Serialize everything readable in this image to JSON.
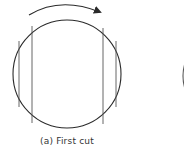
{
  "figure": {
    "caption": "(a) First cut",
    "stroke_color": "#2a2a2a",
    "cut_line_color": "#555555",
    "main_circle": {
      "cx": 67,
      "cy": 74,
      "r": 54
    },
    "rotation_arrow": {
      "direction": "clockwise"
    },
    "cut_lines": [
      {
        "x": 19,
        "y1": 41,
        "y2": 107
      },
      {
        "x": 32,
        "y1": 26,
        "y2": 123
      },
      {
        "x": 103,
        "y1": 28,
        "y2": 124
      },
      {
        "x": 116,
        "y1": 41,
        "y2": 107
      }
    ],
    "partial_circle_right": {
      "visible": true
    }
  }
}
